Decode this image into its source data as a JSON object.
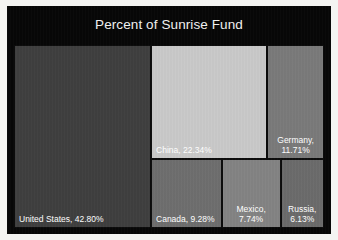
{
  "chart": {
    "title": "Percent of Sunrise Fund",
    "background_color": "#070707",
    "title_color": "#f2f2f2",
    "border_color": "#0c0c0c"
  },
  "chart_data": {
    "type": "treemap",
    "title": "Percent of Sunrise Fund",
    "xlabel": "",
    "ylabel": "",
    "value_unit": "percent",
    "legend": "none",
    "grid": false,
    "categories": [
      "United States",
      "China",
      "Germany",
      "Canada",
      "Mexico",
      "Russia"
    ],
    "values": [
      42.8,
      22.34,
      11.71,
      9.28,
      7.74,
      6.13
    ],
    "labels": [
      "United States, 42.80%",
      "China, 22.34%",
      "Germany,\n11.71%",
      "Canada, 9.28%",
      "Mexico,\n7.74%",
      "Russia,\n6.13%"
    ],
    "colors": [
      "#3f3f3f",
      "#c9c9c9",
      "#7a7a7a",
      "#6e6e6e",
      "#838383",
      "#6b6b6b"
    ],
    "tiles": [
      {
        "name": "united-states",
        "label": "United States, 42.80%",
        "value": 42.8,
        "color": "#3f3f3f",
        "left": 0,
        "top": 0,
        "width": 44.2,
        "height": 100,
        "align": "left"
      },
      {
        "name": "china",
        "label": "China, 22.34%",
        "value": 22.34,
        "color": "#c9c9c9",
        "left": 44.2,
        "top": 0,
        "width": 37.5,
        "height": 62.3,
        "align": "left"
      },
      {
        "name": "germany",
        "label": "Germany,\n11.71%",
        "value": 11.71,
        "color": "#7a7a7a",
        "left": 81.7,
        "top": 0,
        "width": 18.3,
        "height": 62.3,
        "align": "center"
      },
      {
        "name": "canada",
        "label": "Canada, 9.28%",
        "value": 9.28,
        "color": "#6e6e6e",
        "left": 44.2,
        "top": 62.3,
        "width": 22.8,
        "height": 37.7,
        "align": "left"
      },
      {
        "name": "mexico",
        "label": "Mexico,\n7.74%",
        "value": 7.74,
        "color": "#838383",
        "left": 67.0,
        "top": 62.3,
        "width": 19.0,
        "height": 37.7,
        "align": "center"
      },
      {
        "name": "russia",
        "label": "Russia,\n6.13%",
        "value": 6.13,
        "color": "#6b6b6b",
        "left": 86.0,
        "top": 62.3,
        "width": 14.0,
        "height": 37.7,
        "align": "center"
      }
    ]
  }
}
